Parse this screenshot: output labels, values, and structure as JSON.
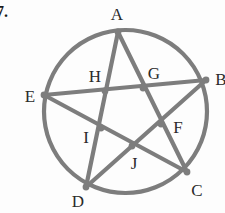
{
  "figure": {
    "item_number": "7.",
    "stroke_color": "#7d7d7d",
    "label_color": "#2a2a2a",
    "background_color": "#fdfdfd",
    "stroke_width": 4.2,
    "node_radius": 3.4,
    "circle": {
      "cx": 125.5,
      "cy": 111.5,
      "r": 81.5
    },
    "outer_vertices": [
      {
        "id": "A",
        "label": "A",
        "x": 118,
        "y": 32,
        "label_x": 117,
        "label_y": 14
      },
      {
        "id": "B",
        "label": "B",
        "x": 206,
        "y": 80,
        "label_x": 221,
        "label_y": 79
      },
      {
        "id": "C",
        "label": "C",
        "x": 187,
        "y": 172,
        "label_x": 197,
        "label_y": 190
      },
      {
        "id": "D",
        "label": "D",
        "x": 86,
        "y": 187,
        "label_x": 78,
        "label_y": 201
      },
      {
        "id": "E",
        "label": "E",
        "x": 44,
        "y": 95,
        "label_x": 30,
        "label_y": 96
      }
    ],
    "inner_vertices": [
      {
        "id": "F",
        "label": "F",
        "x": 161,
        "y": 124,
        "label_x": 178,
        "label_y": 127
      },
      {
        "id": "G",
        "label": "G",
        "x": 143,
        "y": 88,
        "label_x": 154,
        "label_y": 73
      },
      {
        "id": "H",
        "label": "H",
        "x": 105,
        "y": 91,
        "label_x": 95,
        "label_y": 76
      },
      {
        "id": "I",
        "label": "I",
        "x": 101,
        "y": 128,
        "label_x": 86,
        "label_y": 137
      },
      {
        "id": "J",
        "label": "J",
        "x": 132,
        "y": 146,
        "label_x": 134,
        "label_y": 163
      }
    ],
    "chords": [
      {
        "name": "chord-A-C",
        "from": "A",
        "to": "C"
      },
      {
        "name": "chord-C-E",
        "from": "C",
        "to": "E"
      },
      {
        "name": "chord-E-B",
        "from": "E",
        "to": "B"
      },
      {
        "name": "chord-B-D",
        "from": "B",
        "to": "D"
      },
      {
        "name": "chord-D-A",
        "from": "D",
        "to": "A"
      }
    ]
  }
}
